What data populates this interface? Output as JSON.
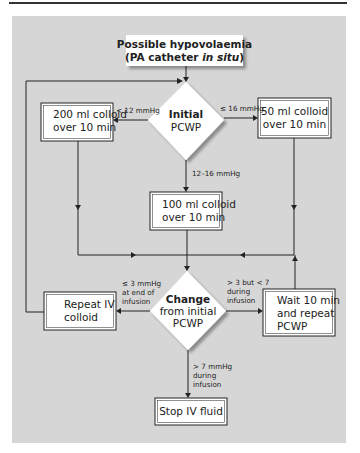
{
  "flowchart": {
    "start": {
      "line1": "Possible hypovolaemia",
      "line2_a": "(PA catheter ",
      "line2_b": "in situ",
      "line2_c": ")"
    },
    "decision_initial": {
      "line1": "Initial",
      "line2": "PCWP"
    },
    "box_200": {
      "line1": "200 ml colloid",
      "line2": "over 10 min"
    },
    "box_50": {
      "line1": "50 ml colloid",
      "line2": "over 10 min"
    },
    "box_100": {
      "line1": "100 ml colloid",
      "line2": "over 10 min"
    },
    "decision_change": {
      "line1": "Change",
      "line2": "from initial",
      "line3": "PCWP"
    },
    "box_repeat": {
      "line1": "Repeat IV",
      "line2": "colloid"
    },
    "box_wait": {
      "line1": "Wait 10 min",
      "line2": "and repeat",
      "line3": "PCWP"
    },
    "box_stop": {
      "line1": "Stop IV fluid"
    },
    "edges": {
      "lt12": "< 12 mmHg",
      "le16": "≤ 16 mmHg",
      "r12_16": "12–16 mmHg",
      "le3": {
        "line1": "≤ 3 mmHg",
        "line2": "at end of",
        "line3": "infusion"
      },
      "gt3lt7": {
        "line1": "> 3 but < 7",
        "line2": "during",
        "line3": "infusion"
      },
      "gt7": {
        "line1": "> 7 mmHg",
        "line2": "during",
        "line3": "infusion"
      }
    }
  },
  "colors": {
    "panel": "#d6d6d6",
    "box": "#ffffff",
    "line": "#222222"
  }
}
